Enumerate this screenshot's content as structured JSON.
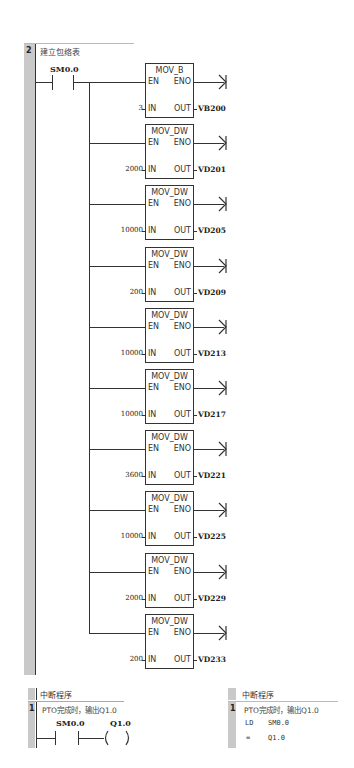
{
  "network2": {
    "number": "2",
    "comment": "建立包络表",
    "contact": "SM0.0",
    "blocks": [
      {
        "title": "MOV_B",
        "en": "EN",
        "eno": "ENO",
        "in_pin": "IN",
        "out_pin": "OUT",
        "in_value": "3",
        "out_value": "VB200"
      },
      {
        "title": "MOV_DW",
        "en": "EN",
        "eno": "ENO",
        "in_pin": "IN",
        "out_pin": "OUT",
        "in_value": "2000",
        "out_value": "VD201"
      },
      {
        "title": "MOV_DW",
        "en": "EN",
        "eno": "ENO",
        "in_pin": "IN",
        "out_pin": "OUT",
        "in_value": "10000",
        "out_value": "VD205"
      },
      {
        "title": "MOV_DW",
        "en": "EN",
        "eno": "ENO",
        "in_pin": "IN",
        "out_pin": "OUT",
        "in_value": "200",
        "out_value": "VD209"
      },
      {
        "title": "MOV_DW",
        "en": "EN",
        "eno": "ENO",
        "in_pin": "IN",
        "out_pin": "OUT",
        "in_value": "10000",
        "out_value": "VD213"
      },
      {
        "title": "MOV_DW",
        "en": "EN",
        "eno": "ENO",
        "in_pin": "IN",
        "out_pin": "OUT",
        "in_value": "10000",
        "out_value": "VD217"
      },
      {
        "title": "MOV_DW",
        "en": "EN",
        "eno": "ENO",
        "in_pin": "IN",
        "out_pin": "OUT",
        "in_value": "3600",
        "out_value": "VD221"
      },
      {
        "title": "MOV_DW",
        "en": "EN",
        "eno": "ENO",
        "in_pin": "IN",
        "out_pin": "OUT",
        "in_value": "10000",
        "out_value": "VD225"
      },
      {
        "title": "MOV_DW",
        "en": "EN",
        "eno": "ENO",
        "in_pin": "IN",
        "out_pin": "OUT",
        "in_value": "2000",
        "out_value": "VD229"
      },
      {
        "title": "MOV_DW",
        "en": "EN",
        "eno": "ENO",
        "in_pin": "IN",
        "out_pin": "OUT",
        "in_value": "200",
        "out_value": "VD233"
      }
    ]
  },
  "interrupt_ladder": {
    "header": "中断程序",
    "number": "1",
    "comment": "PTO完成时，输出Q1.0",
    "contact": "SM0.0",
    "coil": "Q1.0"
  },
  "interrupt_stl": {
    "header": "中断程序",
    "number": "1",
    "comment": "PTO完成时，输出Q1.0",
    "lines": [
      {
        "op": "LD",
        "operand": "SM0.0"
      },
      {
        "op": "=",
        "operand": "Q1.0"
      }
    ]
  }
}
